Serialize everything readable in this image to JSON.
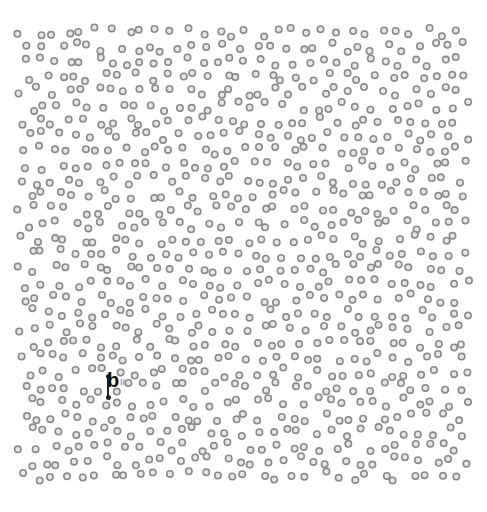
{
  "figure": {
    "panel_label": "b",
    "panel_sublabel": "II",
    "background": "#ffffff",
    "dot_style": {
      "shape": "ring",
      "ring_color": "#8a8a8a",
      "fill_color": "#e6e6e6",
      "radius": 3.2,
      "stroke_width": 1.6
    },
    "lattice": {
      "x_start": 22,
      "x_end": 466,
      "y_start": 32,
      "y_end": 480,
      "spacing_x": 15,
      "spacing_y": 14.8,
      "jitter": 5,
      "seed": 1337
    },
    "annotation": {
      "label_x": 107,
      "label_y": 370,
      "marker_x": 107,
      "marker_top_y": 376,
      "marker_bottom_y": 398
    }
  }
}
